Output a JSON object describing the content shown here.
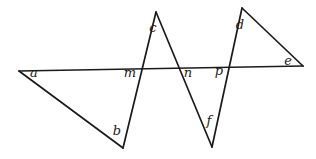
{
  "figure": {
    "width": 316,
    "height": 159,
    "background_color": "#ffffff",
    "ink_color": "#1b1b1b",
    "stroke_width": 1.7,
    "vertices": {
      "a": {
        "x": 19,
        "y": 71
      },
      "b": {
        "x": 123,
        "y": 148
      },
      "c": {
        "x": 156,
        "y": 12
      },
      "d": {
        "x": 242,
        "y": 8
      },
      "e": {
        "x": 303,
        "y": 66
      },
      "f": {
        "x": 212,
        "y": 147
      }
    },
    "crossings": {
      "m": {
        "x": 142,
        "y": 69
      },
      "n": {
        "x": 179,
        "y": 68
      },
      "p": {
        "x": 229,
        "y": 67
      }
    },
    "edges": [
      {
        "from": "a",
        "to": "b"
      },
      {
        "from": "b",
        "to": "c"
      },
      {
        "from": "c",
        "to": "f"
      },
      {
        "from": "f",
        "to": "d"
      },
      {
        "from": "d",
        "to": "e"
      },
      {
        "from": "a",
        "to": "e"
      }
    ],
    "labels": [
      {
        "text": "a",
        "x": 34,
        "y": 76.5
      },
      {
        "text": "b",
        "x": 117,
        "y": 135
      },
      {
        "text": "c",
        "x": 153,
        "y": 32
      },
      {
        "text": "d",
        "x": 240,
        "y": 29
      },
      {
        "text": "e",
        "x": 288,
        "y": 64.5
      },
      {
        "text": "f",
        "x": 209,
        "y": 125
      },
      {
        "text": "m",
        "x": 130,
        "y": 76.5
      },
      {
        "text": "n",
        "x": 188,
        "y": 77
      },
      {
        "text": "p",
        "x": 219,
        "y": 75
      }
    ]
  }
}
